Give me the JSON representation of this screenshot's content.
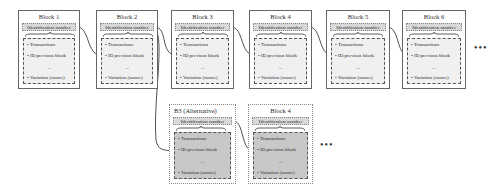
{
  "diagram": {
    "type": "blockchain-fork",
    "main_chain": [
      {
        "title": "Block 1",
        "id_label": "Identification number",
        "fields": [
          "Transactions",
          "ID previous block",
          "...",
          "Variation (nonce)"
        ]
      },
      {
        "title": "Block 2",
        "id_label": "Identification number",
        "fields": [
          "Transactions",
          "ID previous block",
          "...",
          "Variation (nonce)"
        ]
      },
      {
        "title": "Block 3",
        "id_label": "Identification number",
        "fields": [
          "Transactions",
          "ID previous block",
          "...",
          "Variation (nonce)"
        ]
      },
      {
        "title": "Block 4",
        "id_label": "Identification number",
        "fields": [
          "Transactions",
          "ID previous block",
          "...",
          "Variation (nonce)"
        ]
      },
      {
        "title": "Block 5",
        "id_label": "Identification number",
        "fields": [
          "Transactions",
          "ID previous block",
          "...",
          "Variation (nonce)"
        ]
      },
      {
        "title": "Block 6",
        "id_label": "Identification number",
        "fields": [
          "Transactions",
          "ID previous block",
          "...",
          "Variation (nonce)"
        ]
      }
    ],
    "alt_chain": [
      {
        "title": "B3 (Alternative)",
        "id_label": "Identification number",
        "fields": [
          "Transactions",
          "ID previous block",
          "...",
          "Variation (nonce)"
        ]
      },
      {
        "title": "Block 4",
        "id_label": "Identification number",
        "fields": [
          "Transactions",
          "ID previous block",
          "...",
          "Variation (nonce)"
        ]
      }
    ],
    "continuation": "•••",
    "bullet": "•",
    "colors": {
      "id_fill": "#d9d9d9",
      "body_fill": "#f0f0f0",
      "alt_body_fill": "#c8c8c8",
      "border": "#666666"
    }
  }
}
